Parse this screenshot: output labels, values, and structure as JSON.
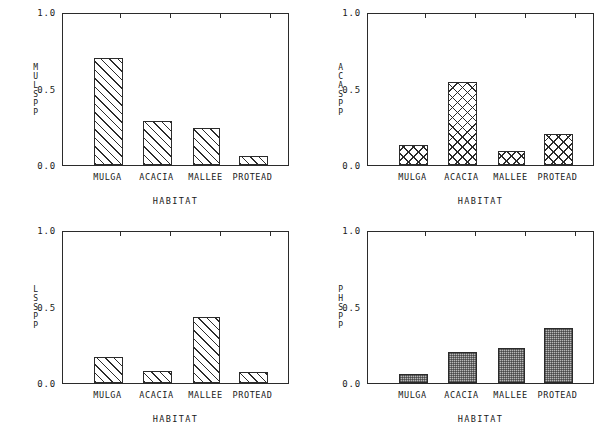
{
  "figure": {
    "title": "",
    "panel_count": 4
  },
  "axis": {
    "yticks": [
      "1.0",
      "0.5",
      "0.0"
    ],
    "ytick_values": [
      1.0,
      0.5,
      0.0
    ],
    "xaxis_title": "HABITAT",
    "categories": [
      "MULGA",
      "ACACIA",
      "MALLEE",
      "PROTEAD"
    ]
  },
  "chart_data": [
    {
      "type": "bar",
      "title": "",
      "ylabel": "MULSPP",
      "xlabel": "HABITAT",
      "categories": [
        "MULGA",
        "ACACIA",
        "MALLEE",
        "PROTEAD"
      ],
      "values": [
        0.7,
        0.29,
        0.24,
        0.06
      ],
      "ylim": [
        0.0,
        1.0
      ],
      "yticks": [
        0.0,
        0.5,
        1.0
      ],
      "grid": false,
      "legend": "none",
      "fill": "diagonal-hatch"
    },
    {
      "type": "bar",
      "title": "",
      "ylabel": "ACASPP",
      "xlabel": "HABITAT",
      "categories": [
        "MULGA",
        "ACACIA",
        "MALLEE",
        "PROTEAD"
      ],
      "values": [
        0.13,
        0.54,
        0.09,
        0.2
      ],
      "ylim": [
        0.0,
        1.0
      ],
      "yticks": [
        0.0,
        0.5,
        1.0
      ],
      "grid": false,
      "legend": "none",
      "fill": "crosshatch"
    },
    {
      "type": "bar",
      "title": "",
      "ylabel": "LSSPP",
      "xlabel": "HABITAT",
      "categories": [
        "MULGA",
        "ACACIA",
        "MALLEE",
        "PROTEAD"
      ],
      "values": [
        0.17,
        0.08,
        0.43,
        0.07
      ],
      "ylim": [
        0.0,
        1.0
      ],
      "yticks": [
        0.0,
        0.5,
        1.0
      ],
      "grid": false,
      "legend": "none",
      "fill": "diagonal-hatch"
    },
    {
      "type": "bar",
      "title": "",
      "ylabel": "PHSPP",
      "xlabel": "HABITAT",
      "categories": [
        "MULGA",
        "ACACIA",
        "MALLEE",
        "PROTEAD"
      ],
      "values": [
        0.06,
        0.2,
        0.23,
        0.36
      ],
      "ylim": [
        0.0,
        1.0
      ],
      "yticks": [
        0.0,
        0.5,
        1.0
      ],
      "grid": false,
      "legend": "none",
      "fill": "stipple-grey"
    }
  ],
  "colors": {
    "axis": "#2b2b2b",
    "background": "#ffffff",
    "hatch": "#2b2b2b",
    "stipple": "#b8b8b8"
  }
}
